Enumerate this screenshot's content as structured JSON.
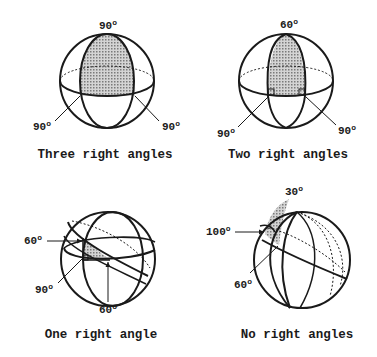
{
  "figure": {
    "panels": [
      {
        "id": "three",
        "caption": "Three right angles",
        "angles": [
          {
            "value": "90",
            "unit": "o",
            "position": "top"
          },
          {
            "value": "90",
            "unit": "o",
            "position": "left"
          },
          {
            "value": "90",
            "unit": "o",
            "position": "right"
          }
        ]
      },
      {
        "id": "two",
        "caption": "Two right angles",
        "angles": [
          {
            "value": "60",
            "unit": "o",
            "position": "top"
          },
          {
            "value": "90",
            "unit": "o",
            "position": "left"
          },
          {
            "value": "90",
            "unit": "o",
            "position": "right"
          }
        ]
      },
      {
        "id": "one",
        "caption": "One right angle",
        "angles": [
          {
            "value": "60",
            "unit": "o",
            "position": "upper-left"
          },
          {
            "value": "90",
            "unit": "o",
            "position": "lower-left"
          },
          {
            "value": "60",
            "unit": "o",
            "position": "bottom"
          }
        ]
      },
      {
        "id": "none",
        "caption": "No right angles",
        "angles": [
          {
            "value": "30",
            "unit": "o",
            "position": "top"
          },
          {
            "value": "100",
            "unit": "o",
            "position": "left"
          },
          {
            "value": "60",
            "unit": "o",
            "position": "lower-left"
          }
        ]
      }
    ],
    "colors": {
      "stroke": "#1a1a1a",
      "shade": "#bdbdbd",
      "background": "#ffffff"
    }
  }
}
